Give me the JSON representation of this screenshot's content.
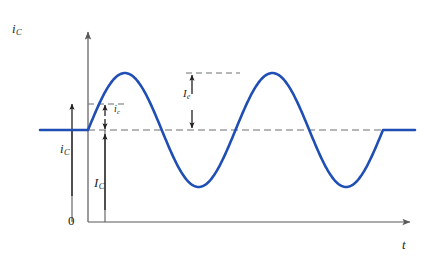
{
  "figure": {
    "background_color": "#ffffff",
    "curve_color": "#1f4eb4",
    "axis_color": "#58595b",
    "dash_color": "#6d6e71",
    "text_color": "#231f20"
  },
  "axes": {
    "y_label": "i",
    "y_label_sub": "C",
    "x_label": "t",
    "x_label_sub": "",
    "origin_label": "0",
    "y_axis_x": 88,
    "x_axis_y": 222,
    "y_axis_top": 28,
    "x_axis_right": 415
  },
  "annotations": {
    "total_current": {
      "label": "i",
      "sub": "C",
      "description": "total instantaneous collector current",
      "arrow_x": 72,
      "from_y": 222,
      "to_y": 130
    },
    "dc_current": {
      "label": "I",
      "sub": "C",
      "description": "dc bias collector current",
      "arrow_x": 105,
      "from_y": 222,
      "to_y": 130
    },
    "ac_small": {
      "label": "i",
      "sub": "c",
      "description": "instantaneous ac collector current",
      "arrow_x": 105,
      "from_y": 130,
      "to_y": 104
    },
    "ac_amplitude": {
      "label": "I",
      "sub": "e",
      "description": "ac current amplitude",
      "arrow_x": 192,
      "from_y": 130,
      "to_y": 73
    }
  },
  "chart_data": {
    "type": "line",
    "title": "",
    "xlabel": "t",
    "ylabel": "i_C",
    "grid": false,
    "legend": false,
    "dc_level": 130,
    "peak_y": 73,
    "trough_y": 186,
    "amplitude_px": 57,
    "flat_start_x": 40,
    "osc_start_x": 88,
    "osc_end_x": 383,
    "flat_end_x": 415,
    "cycles": 2,
    "series": [
      {
        "name": "i_C",
        "description": "dc level, then two sinusoidal cycles, then dc level",
        "color": "#1f4eb4"
      }
    ]
  }
}
